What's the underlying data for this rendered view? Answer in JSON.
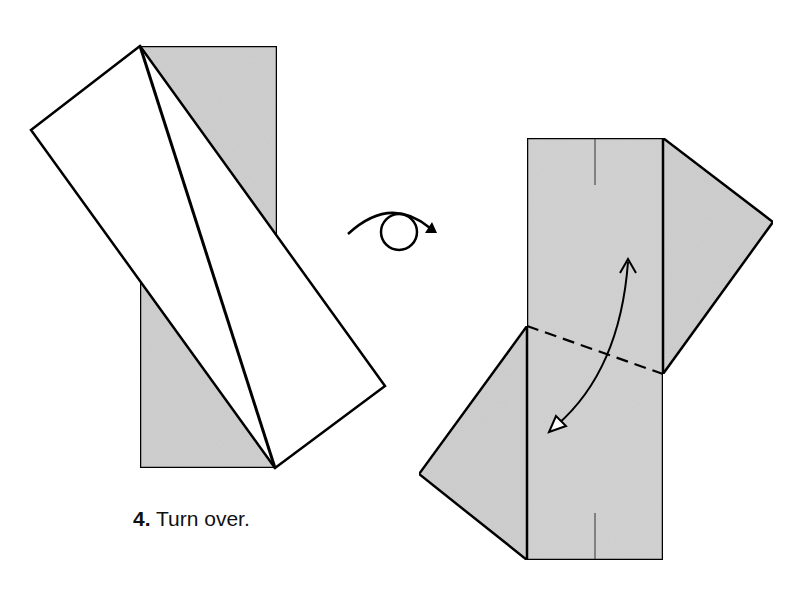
{
  "step": {
    "number": "4.",
    "instruction": "Turn over."
  },
  "colors": {
    "paper_colored": "#d0d0d0",
    "paper_white": "#ffffff",
    "line": "#000000"
  },
  "symbols": {
    "turn_over": "turn-over-icon",
    "fold_arrow": "valley-fold-arrow-icon",
    "fold_line": "dashed-fold-line"
  }
}
